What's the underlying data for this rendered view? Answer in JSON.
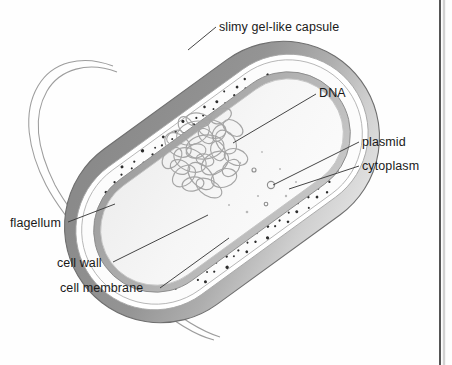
{
  "figure": {
    "background_color": "#fefefe",
    "page_edge_color": "#2b2b2b"
  },
  "labels": {
    "capsule": "slimy gel-like capsule",
    "dna": "DNA",
    "plasmid": "plasmid",
    "cytoplasm": "cytoplasm",
    "flagellum": "flagellum",
    "cell_wall": "cell wall",
    "cell_membrane": "cell membrane"
  },
  "structures": {
    "capsule": {
      "name": "slimy gel-like capsule",
      "fill_dark": "#8e8e8e",
      "fill_light": "#d8d8d8",
      "stroke": "#6f6f6f"
    },
    "periplasm_gap": {
      "name": "clear gap",
      "fill": "#ffffff"
    },
    "cell_wall": {
      "name": "cell wall",
      "fill": "#fbfbfb",
      "stroke": "#9a9a9a",
      "speckle_color": "#2a2a2a",
      "speckle_count": 150
    },
    "cell_membrane": {
      "name": "cell membrane",
      "fill": "#a8a8a8",
      "stroke": "#8a8a8a"
    },
    "cytoplasm": {
      "name": "cytoplasm",
      "fill": "#f3f3f3",
      "stroke": "#bdbdbd"
    },
    "dna": {
      "name": "DNA nucleoid",
      "stroke": "#a3a3a3",
      "loop_count": 26
    },
    "plasmid": {
      "name": "plasmid",
      "stroke": "#8f8f8f",
      "count": 3
    },
    "flagellum": {
      "name": "flagellum",
      "stroke": "#9a9a9a"
    },
    "leader_lines": {
      "stroke": "#3a3a3a"
    }
  },
  "geometry": {
    "cell_rotation_degrees": -36,
    "cell_center_x": 222,
    "cell_center_y": 182
  }
}
